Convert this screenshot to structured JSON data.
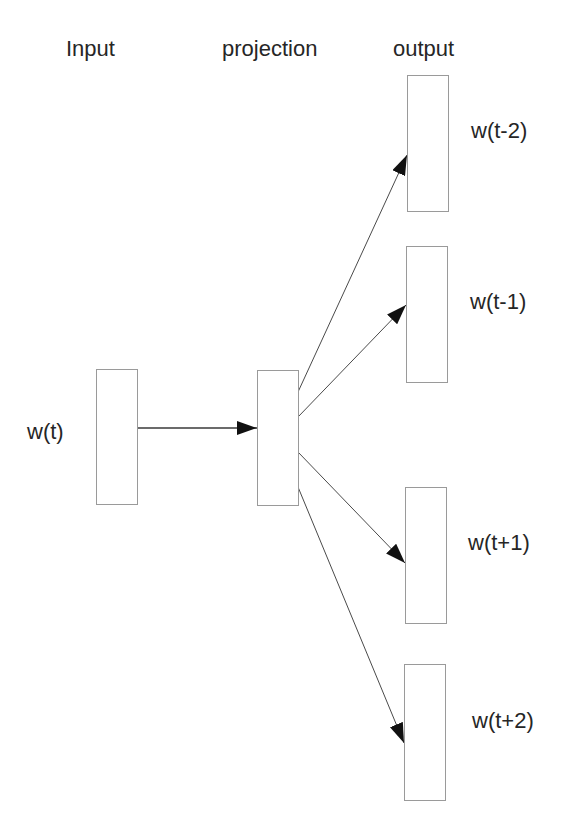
{
  "diagram": {
    "type": "skip-gram architecture",
    "headers": {
      "input": "Input",
      "projection": "projection",
      "output": "output"
    },
    "nodes": {
      "input": {
        "label": "w(t)"
      },
      "projection": {
        "label": ""
      },
      "outputs": [
        {
          "label": "w(t-2)"
        },
        {
          "label": "w(t-1)"
        },
        {
          "label": "w(t+1)"
        },
        {
          "label": "w(t+2)"
        }
      ]
    },
    "edges": [
      {
        "from": "input",
        "to": "projection"
      },
      {
        "from": "projection",
        "to": "w(t-2)"
      },
      {
        "from": "projection",
        "to": "w(t-1)"
      },
      {
        "from": "projection",
        "to": "w(t+1)"
      },
      {
        "from": "projection",
        "to": "w(t+2)"
      }
    ],
    "colors": {
      "line": "#3a3a3a",
      "arrowhead": "#111111",
      "box_border": "#9a9a9a",
      "text": "#262626"
    }
  }
}
